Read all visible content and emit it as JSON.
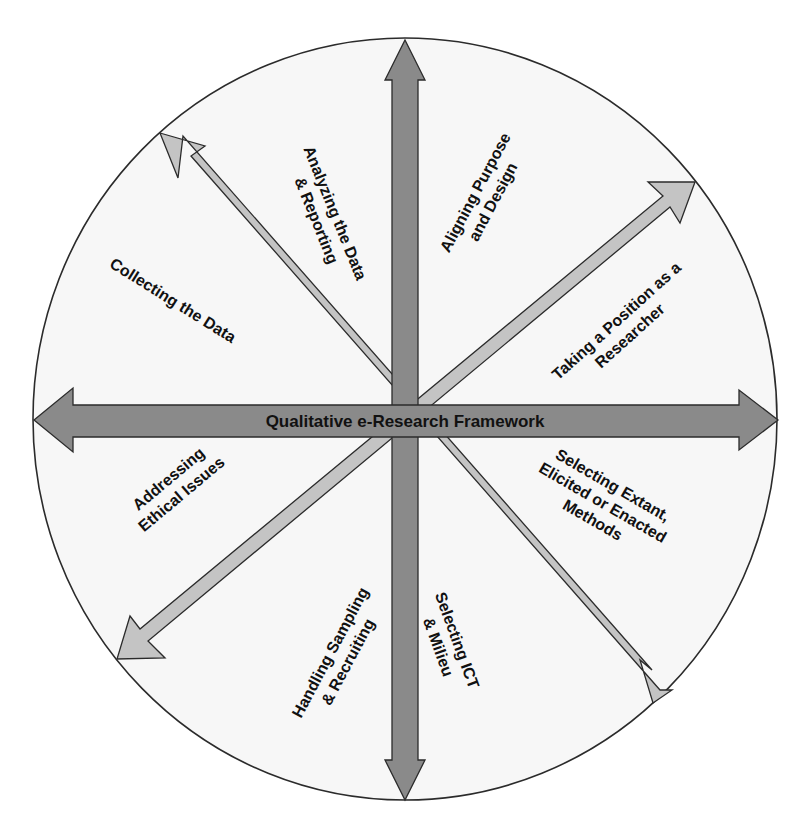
{
  "figure": {
    "center_label": "Qualitative e-Research Framework",
    "colors": {
      "background": "#ffffff",
      "circle_fill": "#f7f7f7",
      "outline": "#2b2b2b",
      "axis_arrow": "#8a8a8a",
      "diagonal_arrow": "#c4c4c4",
      "text": "#111111"
    },
    "labels": [
      {
        "id": "analyzing",
        "lines": [
          "Analyzing the Data",
          "& Reporting"
        ]
      },
      {
        "id": "aligning",
        "lines": [
          "Aligning Purpose",
          "and Design"
        ]
      },
      {
        "id": "position",
        "lines": [
          "Taking a Position as a",
          "Researcher"
        ]
      },
      {
        "id": "methods",
        "lines": [
          "Selecting Extant,",
          "Elicited or Enacted",
          "Methods"
        ]
      },
      {
        "id": "ict",
        "lines": [
          "Selecting ICT",
          "& Milieu"
        ]
      },
      {
        "id": "sampling",
        "lines": [
          "Handling Sampling",
          "& Recruiting"
        ]
      },
      {
        "id": "ethical",
        "lines": [
          "Addressing",
          "Ethical Issues"
        ]
      },
      {
        "id": "collecting",
        "lines": [
          "Collecting the Data"
        ]
      }
    ]
  }
}
